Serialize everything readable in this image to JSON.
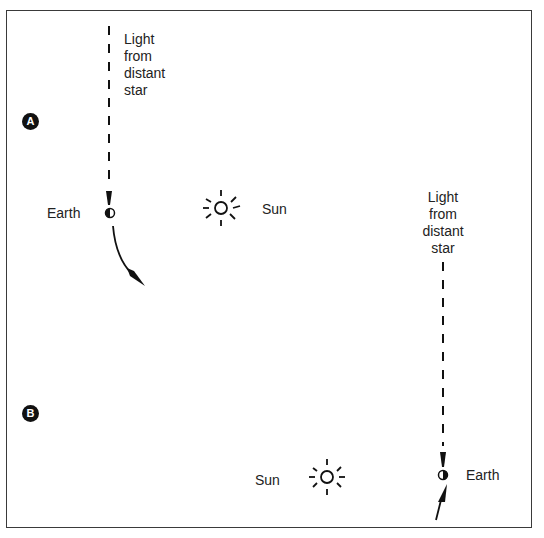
{
  "panel_a": {
    "badge": "A",
    "light_label": "Light\nfrom\ndistant\nstar",
    "earth_label": "Earth",
    "sun_label": "Sun"
  },
  "panel_b": {
    "badge": "B",
    "light_label": "Light\nfrom\ndistant\nstar",
    "earth_label": "Earth",
    "sun_label": "Sun"
  },
  "colors": {
    "ink": "#111111",
    "border": "#3a3a3a",
    "background": "#ffffff"
  }
}
